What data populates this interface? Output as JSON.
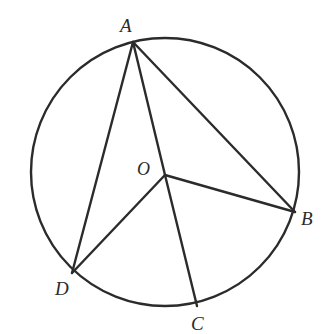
{
  "figure": {
    "type": "circle-with-inscribed-angles",
    "canvas": {
      "width": 327,
      "height": 334
    },
    "stroke_color": "#2b2b2b",
    "label_color": "#2b2b2b",
    "background_color": "#ffffff",
    "circle": {
      "name": "main-circle",
      "center_x": 165,
      "center_y": 172,
      "radius": 134,
      "stroke_width": 2.4
    },
    "points": [
      {
        "id": "A",
        "label": "A",
        "x": 133,
        "y": 42,
        "label_x": 120,
        "label_y": 16,
        "on_circle": true
      },
      {
        "id": "B",
        "label": "B",
        "x": 295,
        "y": 212,
        "label_x": 301,
        "label_y": 209,
        "on_circle": true
      },
      {
        "id": "C",
        "label": "C",
        "x": 197,
        "y": 306,
        "label_x": 191,
        "label_y": 314,
        "on_circle": true
      },
      {
        "id": "D",
        "label": "D",
        "x": 72,
        "y": 273,
        "label_x": 55,
        "label_y": 279,
        "on_circle": true
      },
      {
        "id": "O",
        "label": "O",
        "x": 165,
        "y": 175,
        "label_x": 137,
        "label_y": 160,
        "on_circle": false
      }
    ],
    "segments": [
      {
        "id": "AD",
        "from": "A",
        "to": "D",
        "kind": "chord",
        "x1": 133,
        "y1": 42,
        "x2": 72,
        "y2": 273
      },
      {
        "id": "AB",
        "from": "A",
        "to": "B",
        "kind": "chord",
        "x1": 133,
        "y1": 42,
        "x2": 295,
        "y2": 212
      },
      {
        "id": "AO",
        "from": "A",
        "to": "O",
        "kind": "radius",
        "x1": 133,
        "y1": 42,
        "x2": 165,
        "y2": 175
      },
      {
        "id": "OB",
        "from": "O",
        "to": "B",
        "kind": "radius",
        "x1": 165,
        "y1": 175,
        "x2": 295,
        "y2": 212
      },
      {
        "id": "OC",
        "from": "O",
        "to": "C",
        "kind": "radius",
        "x1": 165,
        "y1": 175,
        "x2": 197,
        "y2": 306
      },
      {
        "id": "OD",
        "from": "O",
        "to": "D",
        "kind": "radius",
        "x1": 165,
        "y1": 175,
        "x2": 72,
        "y2": 273
      }
    ],
    "labels": {
      "A": "A",
      "B": "B",
      "C": "C",
      "D": "D",
      "O": "O"
    }
  }
}
